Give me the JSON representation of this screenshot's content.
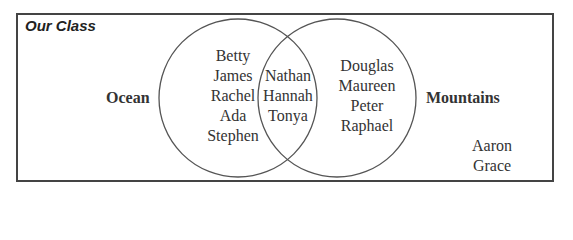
{
  "title": "Our Class",
  "sets": {
    "left": {
      "label": "Ocean",
      "only": [
        "Betty",
        "James",
        "Rachel",
        "Ada",
        "Stephen"
      ]
    },
    "right": {
      "label": "Mountains",
      "only": [
        "Douglas",
        "Maureen",
        "Peter",
        "Raphael"
      ]
    },
    "both": [
      "Nathan",
      "Hannah",
      "Tonya"
    ],
    "neither": [
      "Aaron",
      "Grace"
    ]
  },
  "colors": {
    "stroke": "#555555",
    "text": "#333333",
    "frame": "#444444"
  }
}
